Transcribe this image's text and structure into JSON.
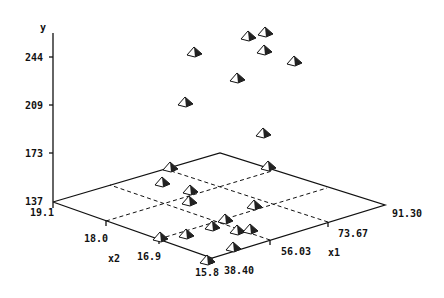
{
  "chart_data": {
    "type": "scatter3d",
    "title": "",
    "axes": {
      "y": {
        "label": "y",
        "ticks": [
          "137",
          "173",
          "209",
          "244"
        ],
        "range": [
          137,
          244
        ]
      },
      "x1": {
        "label": "x1",
        "ticks": [
          "38.40",
          "56.03",
          "73.67",
          "91.30"
        ],
        "range": [
          38.4,
          91.3
        ]
      },
      "x2": {
        "label": "x2",
        "ticks": [
          "19.1",
          "18.0",
          "16.9",
          "15.8"
        ],
        "range": [
          15.8,
          19.1
        ]
      }
    },
    "grid": "dashed base plane grid",
    "marker": "pyramid",
    "points_screen": [
      [
        194,
        47
      ],
      [
        248,
        31
      ],
      [
        265,
        27
      ],
      [
        264,
        45
      ],
      [
        294,
        56
      ],
      [
        237,
        73
      ],
      [
        185,
        97
      ],
      [
        263,
        128
      ],
      [
        170,
        162
      ],
      [
        268,
        161
      ],
      [
        162,
        177
      ],
      [
        190,
        185
      ],
      [
        189,
        196
      ],
      [
        254,
        200
      ],
      [
        225,
        214
      ],
      [
        212,
        221
      ],
      [
        237,
        225
      ],
      [
        250,
        224
      ],
      [
        186,
        229
      ],
      [
        160,
        232
      ],
      [
        233,
        242
      ],
      [
        207,
        255
      ]
    ]
  },
  "labels": {
    "y_axis": "y",
    "y_ticks": [
      "244",
      "209",
      "173",
      "137"
    ],
    "x2_axis": "x2",
    "x2_ticks": [
      "19.1",
      "18.0",
      "16.9",
      "15.8"
    ],
    "x1_axis": "x1",
    "x1_ticks": [
      "38.40",
      "56.03",
      "73.67",
      "91.30"
    ]
  }
}
